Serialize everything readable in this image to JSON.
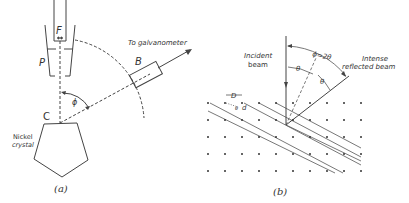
{
  "figure_a": {
    "caption": "(a)",
    "labels": {
      "filament": "F",
      "plate": "P",
      "detector": "B",
      "crystal_point": "C",
      "angle": "ϕ",
      "galvanometer": "To galvanometer",
      "crystal_line1": "Nickel",
      "crystal_line2": "crystal"
    }
  },
  "figure_b": {
    "caption": "(b)",
    "labels": {
      "incident_line1": "Incident",
      "incident_line2": "beam",
      "reflected_line1": "Intense",
      "reflected_line2": "reflected beam",
      "phi_eq": "ϕ=2θ",
      "theta1": "θ",
      "theta2": "θ",
      "spacing_D": "D",
      "spacing_d": "d",
      "small_angle": "θ"
    }
  },
  "colors": {
    "line": "#444444",
    "text": "#333333",
    "dot": "#333333"
  }
}
